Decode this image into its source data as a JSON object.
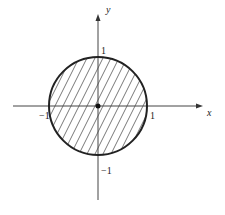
{
  "diagram": {
    "axes": {
      "x_label": "x",
      "y_label": "y"
    },
    "ticks": {
      "x_pos": "1",
      "x_neg": "−1",
      "y_pos": "1",
      "y_neg": "−1"
    },
    "region": {
      "shape": "circle",
      "center": [
        0,
        0
      ],
      "radius": 1,
      "fill": "diagonal-hatch"
    },
    "origin_marker": "dot",
    "colors": {
      "stroke": "#222222",
      "axis": "#444444",
      "hatch": "#555555",
      "background": "#ffffff"
    }
  }
}
